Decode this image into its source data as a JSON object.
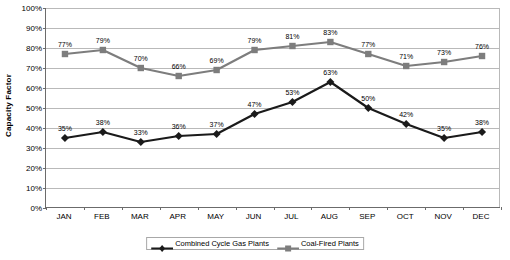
{
  "chart_data": {
    "type": "line",
    "title": "",
    "xlabel": "",
    "ylabel": "Capacity Factor",
    "ylim": [
      0,
      100
    ],
    "ytick_labels": [
      "100%",
      "90%",
      "80%",
      "70%",
      "60%",
      "50%",
      "40%",
      "30%",
      "20%",
      "10%",
      "0%"
    ],
    "ytick_values": [
      100,
      90,
      80,
      70,
      60,
      50,
      40,
      30,
      20,
      10,
      0
    ],
    "grid": true,
    "legend_position": "bottom",
    "categories": [
      "JAN",
      "FEB",
      "MAR",
      "APR",
      "MAY",
      "JUN",
      "JUL",
      "AUG",
      "SEP",
      "OCT",
      "NOV",
      "DEC"
    ],
    "series": [
      {
        "name": "Combined Cycle Gas Plants",
        "color": "#1a1a1a",
        "marker": "diamond",
        "values": [
          35,
          38,
          33,
          36,
          37,
          47,
          53,
          63,
          50,
          42,
          35,
          38
        ],
        "labels": [
          "35%",
          "38%",
          "33%",
          "36%",
          "37%",
          "47%",
          "53%",
          "63%",
          "50%",
          "42%",
          "35%",
          "38%"
        ]
      },
      {
        "name": "Coal-Fired Plants",
        "color": "#7d7d7d",
        "marker": "square",
        "values": [
          77,
          79,
          70,
          66,
          69,
          79,
          81,
          83,
          77,
          71,
          73,
          76
        ],
        "labels": [
          "77%",
          "79%",
          "70%",
          "66%",
          "69%",
          "79%",
          "81%",
          "83%",
          "77%",
          "71%",
          "73%",
          "76%"
        ]
      }
    ]
  },
  "legend": {
    "items": [
      {
        "label": "Combined Cycle Gas Plants"
      },
      {
        "label": "Coal-Fired Plants"
      }
    ]
  },
  "colors": {
    "gas_series": "#1a1a1a",
    "coal_series": "#7d7d7d",
    "gridline": "#b9b9b9",
    "axis": "#6b6b6b",
    "background": "#ffffff"
  }
}
